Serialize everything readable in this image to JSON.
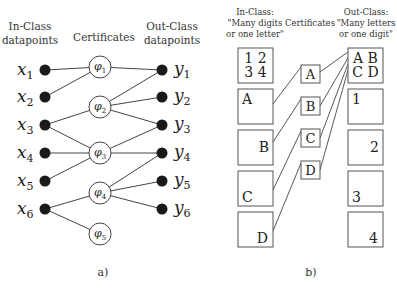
{
  "panel_a": {
    "caption": "a)",
    "headers": {
      "in_class": [
        "In-Class",
        "datapoints"
      ],
      "certificates": "Certificates",
      "out_class": [
        "Out-Class",
        "datapoints"
      ]
    },
    "in_nodes": [
      {
        "label": "x",
        "sub": "1",
        "y": 70
      },
      {
        "label": "x",
        "sub": "2",
        "y": 97
      },
      {
        "label": "x",
        "sub": "3",
        "y": 125
      },
      {
        "label": "x",
        "sub": "4",
        "y": 153
      },
      {
        "label": "x",
        "sub": "5",
        "y": 181
      },
      {
        "label": "x",
        "sub": "6",
        "y": 209
      }
    ],
    "certificates": [
      {
        "label": "φ",
        "sub": "1",
        "y": 67
      },
      {
        "label": "φ",
        "sub": "2",
        "y": 107
      },
      {
        "label": "φ",
        "sub": "3",
        "y": 153
      },
      {
        "label": "φ",
        "sub": "4",
        "y": 193
      },
      {
        "label": "φ",
        "sub": "5",
        "y": 234
      }
    ],
    "out_nodes": [
      {
        "label": "y",
        "sub": "1",
        "y": 70
      },
      {
        "label": "y",
        "sub": "2",
        "y": 97
      },
      {
        "label": "y",
        "sub": "3",
        "y": 125
      },
      {
        "label": "y",
        "sub": "4",
        "y": 153
      },
      {
        "label": "y",
        "sub": "5",
        "y": 181
      },
      {
        "label": "y",
        "sub": "6",
        "y": 209
      }
    ],
    "edges_in": [
      [
        0,
        0
      ],
      [
        1,
        0
      ],
      [
        2,
        1
      ],
      [
        2,
        2
      ],
      [
        3,
        2
      ],
      [
        4,
        2
      ],
      [
        5,
        3
      ],
      [
        5,
        4
      ]
    ],
    "edges_out": [
      [
        0,
        0
      ],
      [
        1,
        0
      ],
      [
        1,
        1
      ],
      [
        1,
        2
      ],
      [
        2,
        2
      ],
      [
        2,
        3
      ],
      [
        3,
        3
      ],
      [
        3,
        4
      ],
      [
        3,
        5
      ]
    ]
  },
  "panel_b": {
    "caption": "b)",
    "headers": {
      "in_class": [
        "In-Class:",
        "\"Many digits",
        "or one letter\""
      ],
      "certificates": "Certificates",
      "out_class": [
        "Out-Class:",
        "\"Many letters",
        "or one digit\""
      ]
    },
    "in_boxes": [
      {
        "lines": [
          "1 2",
          "3 4"
        ],
        "align": "center"
      },
      {
        "lines": [
          "A"
        ],
        "align": "top-left"
      },
      {
        "lines": [
          "B"
        ],
        "align": "mid-right"
      },
      {
        "lines": [
          "C"
        ],
        "align": "bottom-left"
      },
      {
        "lines": [
          "D"
        ],
        "align": "bottom-right"
      }
    ],
    "certificates": [
      "A",
      "B",
      "C",
      "D"
    ],
    "out_boxes": [
      {
        "lines": [
          "A B",
          "C D"
        ],
        "align": "center"
      },
      {
        "lines": [
          "1"
        ],
        "align": "top-left"
      },
      {
        "lines": [
          "2"
        ],
        "align": "mid-right"
      },
      {
        "lines": [
          "3"
        ],
        "align": "bottom-left"
      },
      {
        "lines": [
          "4"
        ],
        "align": "bottom-right"
      }
    ]
  }
}
